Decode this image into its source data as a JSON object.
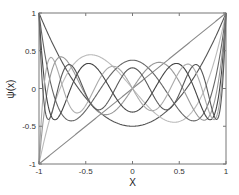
{
  "chart_data": {
    "type": "line",
    "title": "",
    "xlabel": "X",
    "ylabel": "ψ(x)",
    "xlim": [
      -1,
      1
    ],
    "ylim": [
      -1,
      1
    ],
    "grid": false,
    "legend": null,
    "xticks": [
      -1,
      -0.5,
      0,
      0.5,
      1
    ],
    "xtick_labels": [
      "-1",
      "-0.5",
      "0",
      "0.5",
      "1"
    ],
    "yticks": [
      -1,
      -0.5,
      0,
      0.5,
      1
    ],
    "ytick_labels": [
      "-1",
      "-0.5",
      "0",
      "0.5",
      "1"
    ],
    "x": [
      -1,
      -0.75,
      -0.5,
      -0.25,
      0,
      0.25,
      0.5,
      0.75,
      1
    ],
    "series": [
      {
        "name": "P1",
        "color": "#888888",
        "degree": 1,
        "values": [
          -1,
          -0.75,
          -0.5,
          -0.25,
          0,
          0.25,
          0.5,
          0.75,
          1
        ]
      },
      {
        "name": "P2",
        "color": "#555555",
        "degree": 2,
        "values": [
          1,
          0.344,
          -0.125,
          -0.406,
          -0.5,
          -0.406,
          -0.125,
          0.344,
          1
        ]
      },
      {
        "name": "P3",
        "color": "#bbbbbb",
        "degree": 3,
        "values": [
          -1,
          0.047,
          0.438,
          0.336,
          0,
          -0.336,
          -0.438,
          -0.047,
          1
        ]
      },
      {
        "name": "P4",
        "color": "#666666",
        "degree": 4,
        "values": [
          1,
          -0.333,
          -0.289,
          0.232,
          0.375,
          0.232,
          -0.289,
          -0.333,
          1
        ]
      },
      {
        "name": "P5",
        "color": "#999999",
        "degree": 5,
        "values": [
          -1,
          0.369,
          -0.09,
          -0.347,
          0,
          0.347,
          0.09,
          -0.369,
          1
        ]
      },
      {
        "name": "P6",
        "color": "#444444",
        "degree": 6,
        "values": [
          1,
          -0.127,
          0.323,
          0.013,
          -0.313,
          0.013,
          0.323,
          -0.127,
          1
        ]
      },
      {
        "name": "P7",
        "color": "#aaaaaa",
        "degree": 7,
        "values": [
          -1,
          -0.137,
          -0.223,
          0.314,
          0,
          -0.314,
          0.223,
          0.137,
          1
        ]
      },
      {
        "name": "P8",
        "color": "#5a5a5a",
        "degree": 8,
        "values": [
          1,
          0.305,
          0.025,
          -0.258,
          0.273,
          -0.258,
          0.025,
          0.305,
          1
        ]
      }
    ]
  }
}
